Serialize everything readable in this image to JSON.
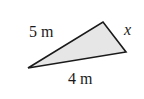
{
  "diagram": {
    "type": "triangle",
    "fill_color": "#e6e6e6",
    "stroke_color": "#1a1a1a",
    "vertices": {
      "left": [
        28,
        68
      ],
      "top": [
        103,
        22
      ],
      "right": [
        126,
        52
      ]
    },
    "labels": {
      "side_left_top": "5 m",
      "side_top_right": "x",
      "side_left_right": "4 m"
    }
  }
}
